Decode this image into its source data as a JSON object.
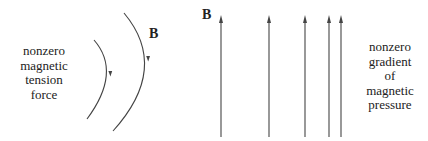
{
  "left_panel": {
    "caption_lines": [
      "nonzero",
      "magnetic",
      "tension",
      "force"
    ],
    "field_label": "B",
    "description": "curved magnetic field lines"
  },
  "right_panel": {
    "caption_lines": [
      "nonzero",
      "gradient",
      "of",
      "magnetic",
      "pressure"
    ],
    "field_label": "B",
    "description": "straight parallel field lines with converging spacing",
    "line_x_positions": [
      221,
      269,
      305,
      329,
      341
    ]
  },
  "colors": {
    "line": "#444444",
    "text": "#222222",
    "background": "#ffffff"
  }
}
